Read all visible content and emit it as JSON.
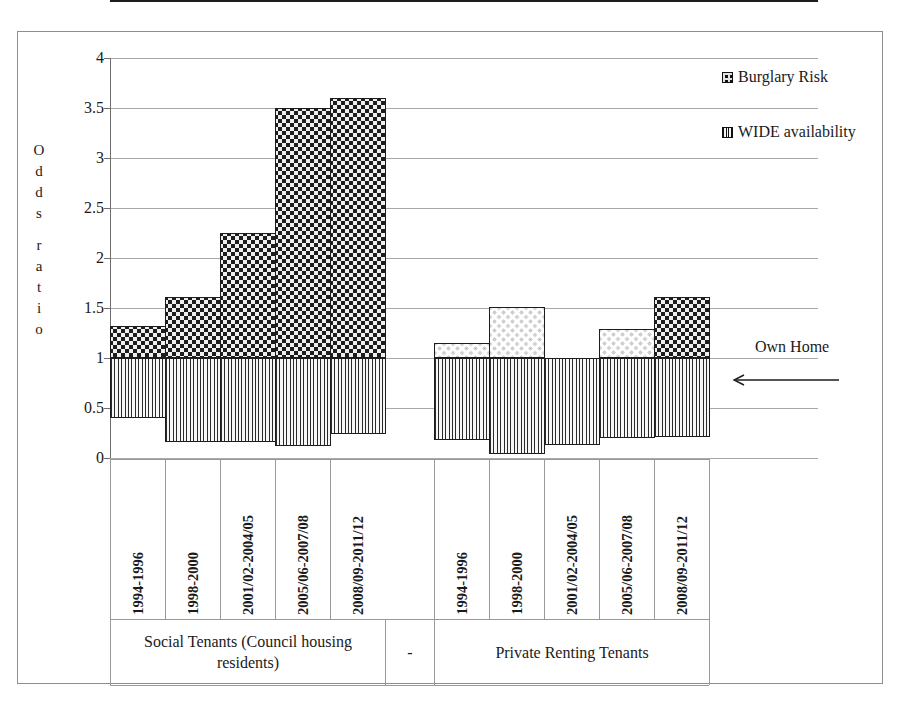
{
  "chart_data": {
    "type": "bar",
    "title": "",
    "subtitle": "",
    "xlabel": "",
    "ylabel": "Odds ratio",
    "ylabel_letters": [
      "O",
      "d",
      "d",
      "s",
      "",
      "r",
      "a",
      "t",
      "i",
      "o"
    ],
    "ylim": [
      0,
      4
    ],
    "yticks": [
      "0",
      "0.5",
      "1",
      "1.5",
      "2",
      "2.5",
      "3",
      "3.5",
      "4"
    ],
    "ytick_values": [
      0,
      0.5,
      1,
      1.5,
      2,
      2.5,
      3,
      3.5,
      4
    ],
    "grid": true,
    "reference_line": 1,
    "legend_position": "right",
    "legend": [
      "Burglary Risk",
      "WIDE availability"
    ],
    "annotations": [
      {
        "text": "Own Home",
        "points_to": "reference line at odds ratio = 1",
        "arrow": "left"
      }
    ],
    "categories": [
      "1994-1996",
      "1998-2000",
      "2001/02-2004/05",
      "2005/06-2007/08",
      "2008/09-2011/12",
      "1994-1996",
      "1998-2000",
      "2001/02-2004/05",
      "2005/06-2007/08",
      "2008/09-2011/12"
    ],
    "groups": [
      {
        "label": "Social Tenants (Council housing residents)",
        "categories": 5
      },
      {
        "label": "-",
        "categories": 0
      },
      {
        "label": "Private Renting Tenants",
        "categories": 5
      }
    ],
    "series": [
      {
        "name": "Burglary Risk",
        "pattern": "dots",
        "baseline": 1,
        "values": [
          1.32,
          1.61,
          2.25,
          3.5,
          3.6,
          1.15,
          1.51,
          0.98,
          1.29,
          1.61
        ]
      },
      {
        "name": "WIDE availability",
        "pattern": "vertical-lines",
        "baseline": 1,
        "values": [
          0.4,
          0.16,
          0.16,
          0.12,
          0.24,
          0.18,
          0.04,
          0.13,
          0.2,
          0.21
        ]
      }
    ]
  },
  "legend": {
    "items": [
      {
        "label": "Burglary Risk",
        "swatch": "dots-swatch"
      },
      {
        "label": "WIDE availability",
        "swatch": "vertical-lines-swatch"
      }
    ]
  },
  "axis": {
    "y_title_letters": [
      "O",
      "d",
      "d",
      "s",
      "",
      "r",
      "a",
      "t",
      "i",
      "o"
    ],
    "y_ticks": [
      "4",
      "3.5",
      "3",
      "2.5",
      "2",
      "1.5",
      "1",
      "0.5",
      "0"
    ]
  },
  "categories": [
    "1994-1996",
    "1998-2000",
    "2001/02-2004/05",
    "2005/06-2007/08",
    "2008/09-2011/12",
    "1994-1996",
    "1998-2000",
    "2001/02-2004/05",
    "2005/06-2007/08",
    "2008/09-2011/12"
  ],
  "group_labels": {
    "social": "Social Tenants (Council housing residents)",
    "separator": "-",
    "private": "Private Renting Tenants"
  },
  "annotation": {
    "own_home": "Own Home"
  }
}
